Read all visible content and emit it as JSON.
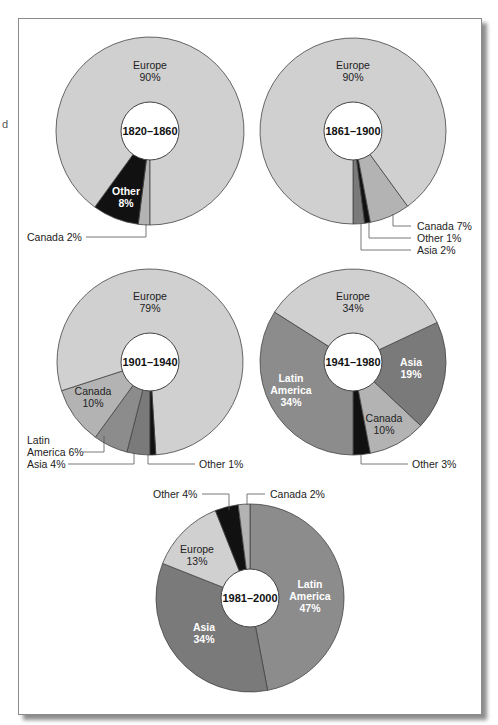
{
  "chart_data": [
    {
      "type": "pie",
      "title": "1820–1860",
      "style": "donut",
      "categories": [
        "Europe",
        "Canada",
        "Other"
      ],
      "values": [
        90,
        2,
        8
      ],
      "labels": {
        "Europe": "Europe 90%",
        "Canada": "Canada 2%",
        "Other": "Other 8%"
      }
    },
    {
      "type": "pie",
      "title": "1861–1900",
      "style": "donut",
      "categories": [
        "Europe",
        "Canada",
        "Other",
        "Asia"
      ],
      "values": [
        90,
        7,
        1,
        2
      ],
      "labels": {
        "Europe": "Europe 90%",
        "Canada": "Canada 7%",
        "Other": "Other 1%",
        "Asia": "Asia 2%"
      }
    },
    {
      "type": "pie",
      "title": "1901–1940",
      "style": "donut",
      "categories": [
        "Europe",
        "Canada",
        "Latin America",
        "Asia",
        "Other"
      ],
      "values": [
        79,
        10,
        6,
        4,
        1
      ],
      "labels": {
        "Europe": "Europe 79%",
        "Canada": "Canada 10%",
        "Latin America": "Latin America 6%",
        "Asia": "Asia 4%",
        "Other": "Other 1%"
      }
    },
    {
      "type": "pie",
      "title": "1941–1980",
      "style": "donut",
      "categories": [
        "Europe",
        "Asia",
        "Canada",
        "Other",
        "Latin America"
      ],
      "values": [
        34,
        19,
        10,
        3,
        34
      ],
      "labels": {
        "Europe": "Europe 34%",
        "Asia": "Asia 19%",
        "Canada": "Canada 10%",
        "Other": "Other 3%",
        "Latin America": "Latin America 34%"
      }
    },
    {
      "type": "pie",
      "title": "1981–2000",
      "style": "donut",
      "categories": [
        "Latin America",
        "Asia",
        "Europe",
        "Other",
        "Canada"
      ],
      "values": [
        47,
        34,
        13,
        4,
        2
      ],
      "labels": {
        "Latin America": "Latin America 47%",
        "Asia": "Asia 34%",
        "Europe": "Europe 13%",
        "Other": "Other 4%",
        "Canada": "Canada 2%"
      }
    }
  ],
  "colors": {
    "Europe": "#d0d0d0",
    "Canada": "#b3b3b3",
    "Latin America": "#8c8c8c",
    "Asia": "#7a7a7a",
    "Other": "#111111",
    "outline": "#444444"
  },
  "text": {
    "edge_fragment": "d",
    "p1": {
      "center": "1820–1860",
      "europe_name": "Europe",
      "europe_pct": "90%",
      "other_name": "Other",
      "other_pct": "8%",
      "canada": "Canada 2%"
    },
    "p2": {
      "center": "1861–1900",
      "europe_name": "Europe",
      "europe_pct": "90%",
      "canada": "Canada 7%",
      "other": "Other 1%",
      "asia": "Asia 2%"
    },
    "p3": {
      "center": "1901–1940",
      "europe_name": "Europe",
      "europe_pct": "79%",
      "canada_name": "Canada",
      "canada_pct": "10%",
      "latin1": "Latin",
      "latin2": "America 6%",
      "asia": "Asia 4%",
      "other": "Other 1%"
    },
    "p4": {
      "center": "1941–1980",
      "europe_name": "Europe",
      "europe_pct": "34%",
      "asia_name": "Asia",
      "asia_pct": "19%",
      "latin1": "Latin",
      "latin2": "America",
      "latin_pct": "34%",
      "canada_name": "Canada",
      "canada_pct": "10%",
      "other": "Other 3%"
    },
    "p5": {
      "center": "1981–2000",
      "other": "Other 4%",
      "canada": "Canada 2%",
      "europe_name": "Europe",
      "europe_pct": "13%",
      "latin1": "Latin",
      "latin2": "America",
      "latin_pct": "47%",
      "asia_name": "Asia",
      "asia_pct": "34%"
    }
  }
}
